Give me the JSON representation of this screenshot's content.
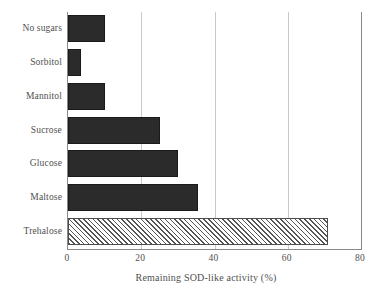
{
  "chart_data": {
    "type": "bar",
    "orientation": "horizontal",
    "title": "",
    "xlabel": "Remaining SOD-like activity (%)",
    "ylabel": "",
    "xlim": [
      0,
      80
    ],
    "xticks": [
      0,
      20,
      40,
      60,
      80
    ],
    "xtick_labels": [
      "0",
      "20",
      "40",
      "60",
      "80"
    ],
    "gridlines": [
      20,
      40,
      60
    ],
    "grid": true,
    "legend": null,
    "categories": [
      "Trehalose",
      "Maltose",
      "Glucose",
      "Sucrose",
      "Mannitol",
      "Sorbitol",
      "No sugars"
    ],
    "values": [
      71,
      35.5,
      30,
      25,
      10,
      3.5,
      10
    ],
    "bars": [
      {
        "label": "No sugars",
        "value": 10,
        "style": "solid",
        "color": "#2b2b2b"
      },
      {
        "label": "Sorbitol",
        "value": 3.5,
        "style": "solid",
        "color": "#2b2b2b"
      },
      {
        "label": "Mannitol",
        "value": 10,
        "style": "solid",
        "color": "#2b2b2b"
      },
      {
        "label": "Sucrose",
        "value": 25,
        "style": "solid",
        "color": "#2b2b2b"
      },
      {
        "label": "Glucose",
        "value": 30,
        "style": "solid",
        "color": "#2b2b2b"
      },
      {
        "label": "Maltose",
        "value": 35.5,
        "style": "solid",
        "color": "#2b2b2b"
      },
      {
        "label": "Trehalose",
        "value": 71,
        "style": "hatched",
        "color": "#ffffff"
      }
    ],
    "colors": {
      "bar_fill": "#2b2b2b",
      "hatch_line": "#555555",
      "hatch_background": "#ffffff",
      "gridline": "#c9c9c9",
      "axis": "#8a8a8a",
      "text": "#4f4f4f",
      "background": "#ffffff"
    }
  }
}
